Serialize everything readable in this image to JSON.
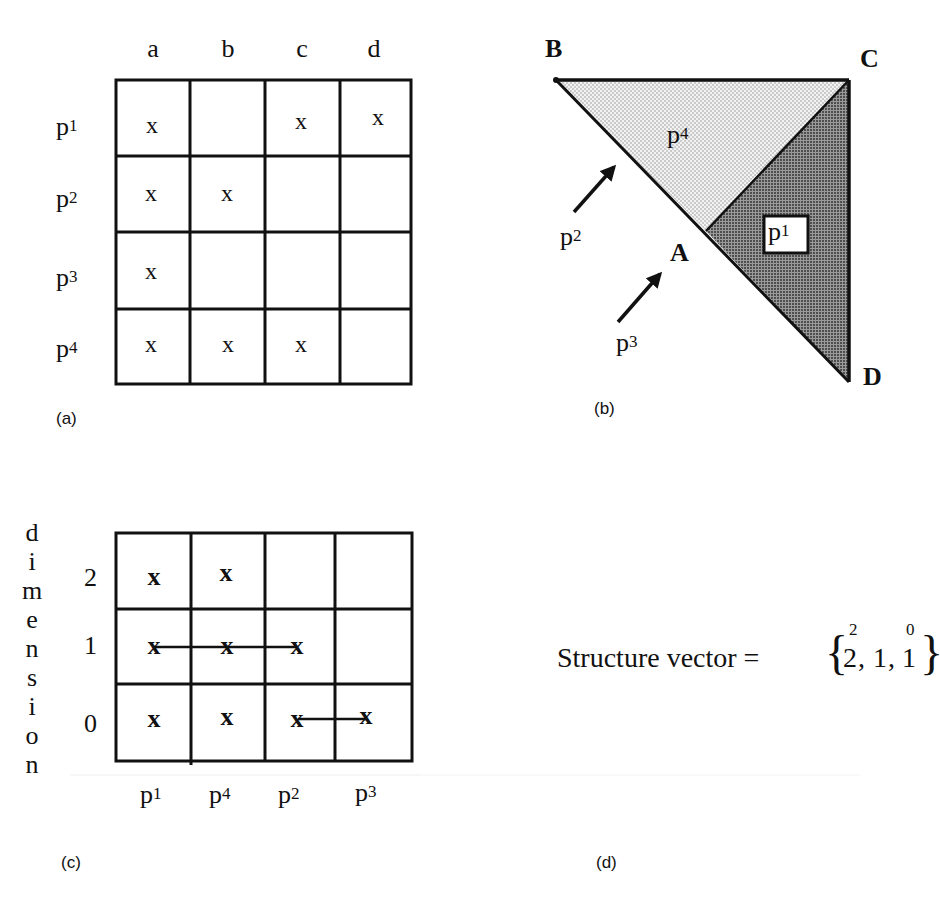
{
  "figure": {
    "panels": {
      "a": {
        "caption": "(a)",
        "type": "incidence-matrix",
        "columns": [
          "a",
          "b",
          "c",
          "d"
        ],
        "rows": [
          {
            "label": "p",
            "sub": "1",
            "cells": [
              "x",
              "",
              "x",
              "x"
            ]
          },
          {
            "label": "p",
            "sub": "2",
            "cells": [
              "x",
              "x",
              "",
              ""
            ]
          },
          {
            "label": "p",
            "sub": "3",
            "cells": [
              "x",
              "",
              "",
              ""
            ]
          },
          {
            "label": "p",
            "sub": "4",
            "cells": [
              "x",
              "x",
              "x",
              ""
            ]
          }
        ]
      },
      "b": {
        "caption": "(b)",
        "type": "simplicial-complex",
        "vertices": {
          "B": "B",
          "C": "C",
          "A": "A",
          "D": "D"
        },
        "regions": {
          "p4": {
            "label": "p",
            "sub": "4",
            "fill": "light-dotted"
          },
          "p1": {
            "label": "p",
            "sub": "1",
            "fill": "dark-dotted"
          }
        },
        "arrows": [
          {
            "label": "p",
            "sub": "2",
            "points_to": "edge BA"
          },
          {
            "label": "p",
            "sub": "3",
            "points_to": "vertex A"
          }
        ]
      },
      "c": {
        "caption": "(c)",
        "type": "dimension-matrix",
        "y_axis_label": [
          "d",
          "i",
          "m",
          "e",
          "n",
          "s",
          "i",
          "o",
          "n"
        ],
        "row_labels": [
          "2",
          "1",
          "0"
        ],
        "columns": [
          {
            "label": "p",
            "sub": "1"
          },
          {
            "label": "p",
            "sub": "4"
          },
          {
            "label": "p",
            "sub": "2"
          },
          {
            "label": "p",
            "sub": "3"
          }
        ],
        "cells": [
          [
            "x",
            "x",
            "",
            ""
          ],
          [
            "x",
            "x",
            "x",
            ""
          ],
          [
            "x",
            "x",
            "x",
            "x"
          ]
        ],
        "connections": [
          {
            "row": "1",
            "from": "p1",
            "to": "p2"
          },
          {
            "row": "0",
            "from": "p2",
            "to": "p3"
          }
        ]
      },
      "d": {
        "caption": "(d)",
        "type": "structure-vector",
        "label": "Structure vector =",
        "brace_open": "{",
        "brace_close": "}",
        "entries": [
          {
            "value": "2",
            "sup": "2"
          },
          {
            "value": "1",
            "sup": ""
          },
          {
            "value": "1",
            "sup": "0"
          }
        ],
        "separator": ","
      }
    },
    "colors": {
      "line": "#111111",
      "fill_light": "#d9d9d9",
      "fill_dark": "#7a7a7a",
      "background": "#ffffff"
    }
  }
}
